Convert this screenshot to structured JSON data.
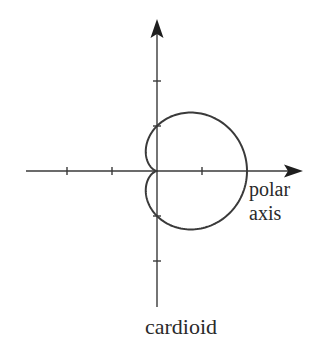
{
  "diagram": {
    "caption": "cardioid",
    "axis_label_line1": "polar",
    "axis_label_line2": "axis"
  },
  "chart_data": {
    "type": "line",
    "title": "cardioid",
    "equation": "r = 1 + cos θ",
    "coordinate_system": "polar",
    "axis_label": "polar axis",
    "x_ticks": [
      -3,
      -1,
      1
    ],
    "x_tick_positions": [
      -2,
      -1,
      1
    ],
    "y_tick_positions": [
      2,
      1,
      -1,
      -2
    ],
    "xlim": [
      -3,
      3.3
    ],
    "ylim": [
      -3,
      3.4
    ],
    "key_points": [
      {
        "theta": "0",
        "r": 2,
        "x": 2,
        "y": 0
      },
      {
        "theta": "π/2",
        "r": 1,
        "x": 0,
        "y": 1
      },
      {
        "theta": "π",
        "r": 0,
        "x": 0,
        "y": 0
      },
      {
        "theta": "3π/2",
        "r": 1,
        "x": 0,
        "y": -1
      }
    ],
    "grid": false,
    "legend": null
  },
  "layout": {
    "origin_px": [
      157,
      171
    ],
    "unit_px": 45,
    "colors": {
      "stroke": "#3a3a3a",
      "arrow": "#1e1e1e",
      "text": "#2a2a2a",
      "background": "#ffffff"
    }
  }
}
